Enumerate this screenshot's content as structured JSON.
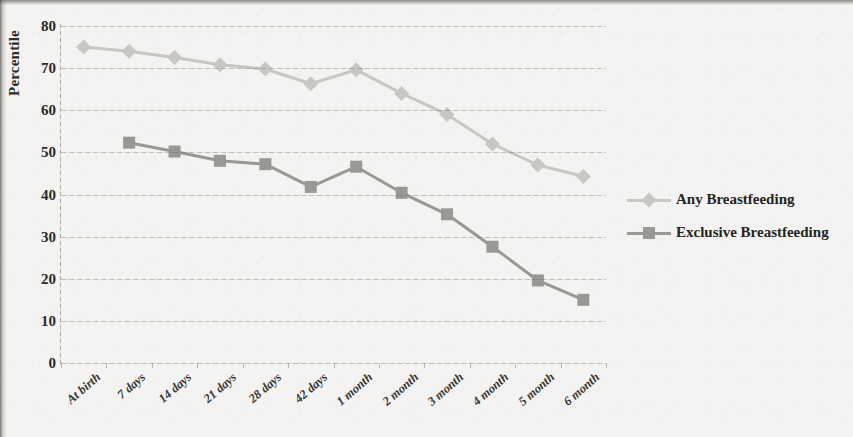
{
  "chart_data": {
    "type": "line",
    "title": "",
    "xlabel": "",
    "ylabel": "Percentile",
    "ylim": [
      0,
      80
    ],
    "ystep": 10,
    "ytick_labels": [
      "80",
      "70",
      "60",
      "50",
      "40",
      "30",
      "20",
      "10",
      "0"
    ],
    "grid": true,
    "legend_position": "right",
    "categories": [
      "At birth",
      "7 days",
      "14 days",
      "21 days",
      "28 days",
      "42 days",
      "1 month",
      "2 month",
      "3 month",
      "4 month",
      "5 month",
      "6 month"
    ],
    "series": [
      {
        "name": "Any Breastfeeding",
        "color": "#c9c7c4",
        "marker": "diamond",
        "values": [
          75,
          74,
          72.5,
          70.8,
          69.8,
          66.3,
          69.6,
          64,
          59,
          52,
          47,
          44.3
        ]
      },
      {
        "name": "Exclusive Breastfeeding",
        "color": "#9a9895",
        "marker": "square",
        "values": [
          null,
          52.3,
          50.2,
          48,
          47.2,
          41.8,
          46.6,
          40.4,
          35.3,
          27.6,
          19.6,
          15
        ]
      }
    ]
  },
  "legend": {
    "entries": [
      {
        "label": "Any Breastfeeding"
      },
      {
        "label": "Exclusive Breastfeeding"
      }
    ]
  }
}
